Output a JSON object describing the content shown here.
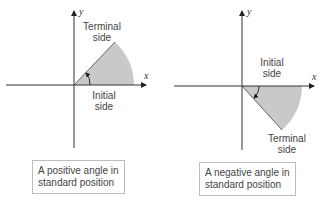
{
  "figures": [
    {
      "id": "positive",
      "x_label": "x",
      "y_label": "y",
      "terminal_label_line1": "Terminal",
      "terminal_label_line2": "side",
      "initial_label_line1": "Initial",
      "initial_label_line2": "side",
      "caption_line1": "A positive angle in",
      "caption_line2": "standard position",
      "direction": "counterclockwise"
    },
    {
      "id": "negative",
      "x_label": "x",
      "y_label": "y",
      "initial_label_line1": "Initial",
      "initial_label_line2": "side",
      "terminal_label_line1": "Terminal",
      "terminal_label_line2": "side",
      "caption_line1": "A negative angle in",
      "caption_line2": "standard position",
      "direction": "clockwise"
    }
  ],
  "colors": {
    "wedge_fill": "#c9c9c9",
    "axis": "#333333",
    "caption_border": "#bdbdbd"
  }
}
